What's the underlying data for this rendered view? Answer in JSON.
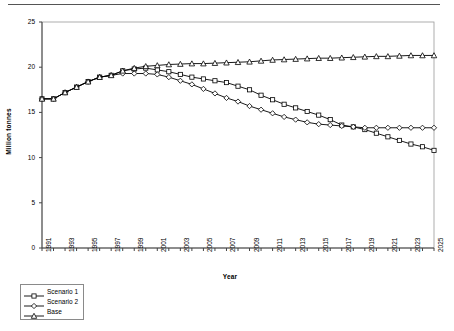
{
  "chart_data": {
    "type": "line",
    "title": "",
    "xlabel": "Year",
    "ylabel": "Million tonnes",
    "xlim": [
      1991,
      2025
    ],
    "ylim": [
      0,
      25
    ],
    "yticks": [
      0,
      5,
      10,
      15,
      20,
      25
    ],
    "ytick_labels": [
      "0",
      "5",
      "10",
      "15",
      "20",
      "25"
    ],
    "grid": false,
    "legend_position": "below-left",
    "x": [
      1991,
      1992,
      1993,
      1994,
      1995,
      1996,
      1997,
      1998,
      1999,
      2000,
      2001,
      2002,
      2003,
      2004,
      2005,
      2006,
      2007,
      2008,
      2009,
      2010,
      2011,
      2012,
      2013,
      2014,
      2015,
      2016,
      2017,
      2018,
      2019,
      2020,
      2021,
      2022,
      2023,
      2024,
      2025
    ],
    "xtick_labels": [
      "1991",
      "1993",
      "1995",
      "1997",
      "1999",
      "2001",
      "2003",
      "2005",
      "2007",
      "2009",
      "2011",
      "2013",
      "2015",
      "2017",
      "2019",
      "2021",
      "2023",
      "2025"
    ],
    "xtick_values": [
      1991,
      1993,
      1995,
      1997,
      1999,
      2001,
      2003,
      2005,
      2007,
      2009,
      2011,
      2013,
      2015,
      2017,
      2019,
      2021,
      2023,
      2025
    ],
    "series": [
      {
        "name": "Scenario 1",
        "marker": "square",
        "color": "#000000",
        "values": [
          16.5,
          16.5,
          17.2,
          17.8,
          18.4,
          18.9,
          19.1,
          19.6,
          19.8,
          19.9,
          19.7,
          19.5,
          19.2,
          18.9,
          18.7,
          18.5,
          18.3,
          17.9,
          17.5,
          16.9,
          16.4,
          15.9,
          15.5,
          15.1,
          14.7,
          14.2,
          13.6,
          13.4,
          13.1,
          12.7,
          12.3,
          11.9,
          11.5,
          11.2,
          10.8
        ]
      },
      {
        "name": "Scenario 2",
        "marker": "diamond",
        "color": "#000000",
        "values": [
          16.5,
          16.5,
          17.2,
          17.8,
          18.4,
          18.9,
          19.1,
          19.3,
          19.3,
          19.3,
          19.2,
          18.9,
          18.5,
          18.1,
          17.6,
          17.1,
          16.6,
          16.2,
          15.7,
          15.3,
          14.9,
          14.5,
          14.2,
          13.9,
          13.7,
          13.6,
          13.5,
          13.4,
          13.3,
          13.3,
          13.3,
          13.3,
          13.3,
          13.3,
          13.3
        ]
      },
      {
        "name": "Base",
        "marker": "triangle",
        "color": "#000000",
        "values": [
          16.5,
          16.5,
          17.2,
          17.8,
          18.4,
          18.9,
          19.1,
          19.6,
          19.9,
          20.1,
          20.2,
          20.3,
          20.35,
          20.4,
          20.4,
          20.45,
          20.5,
          20.55,
          20.6,
          20.7,
          20.8,
          20.85,
          20.9,
          20.95,
          21.0,
          21.0,
          21.05,
          21.1,
          21.15,
          21.2,
          21.2,
          21.25,
          21.3,
          21.3,
          21.3
        ]
      }
    ],
    "legend": [
      {
        "label": "Scenario 1",
        "marker": "square"
      },
      {
        "label": "Scenario 2",
        "marker": "diamond"
      },
      {
        "label": "Base",
        "marker": "triangle"
      }
    ]
  }
}
